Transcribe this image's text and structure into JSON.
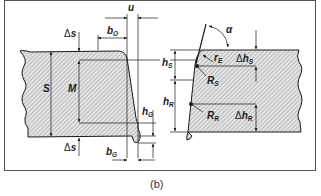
{
  "figure": {
    "caption": "(b)",
    "colors": {
      "frame": "#555555",
      "ink": "#1a1a1a",
      "hatch_fill": "#d8d8d8",
      "background": "#ffffff"
    },
    "left_panel": {
      "description": "Cross-section of clinched/sheared edge showing dimensions",
      "labels": {
        "u": "u",
        "b_O": {
          "main": "b",
          "sub": "O"
        },
        "delta_s_top": {
          "delta": "Δ",
          "main": "s"
        },
        "delta_s_bottom": {
          "delta": "Δ",
          "main": "s"
        },
        "S": "S",
        "M": "M",
        "h_G": {
          "main": "h",
          "sub": "G"
        },
        "b_G": {
          "main": "b",
          "sub": "G"
        }
      }
    },
    "right_panel": {
      "description": "Cross-section of cut edge showing zone heights and radii",
      "labels": {
        "alpha": "α",
        "r_E": {
          "main": "r",
          "sub": "E"
        },
        "delta_h_S": {
          "delta": "Δ",
          "main": "h",
          "sub": "S"
        },
        "h_S": {
          "main": "h",
          "sub": "S"
        },
        "R_S": {
          "main": "R",
          "sub": "S"
        },
        "h_R": {
          "main": "h",
          "sub": "R"
        },
        "R_R": {
          "main": "R",
          "sub": "R"
        },
        "delta_h_R": {
          "delta": "Δ",
          "main": "h",
          "sub": "R"
        }
      }
    }
  }
}
